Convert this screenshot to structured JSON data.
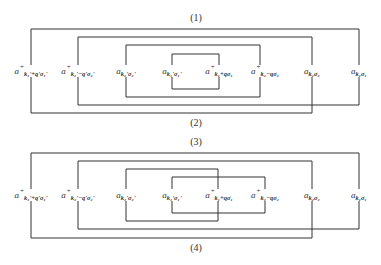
{
  "colors": {
    "line": "#333333",
    "text": "#333333",
    "background": "#ffffff"
  },
  "diagrams": [
    {
      "top_caption": "(1)",
      "bottom_caption": "(2)",
      "operators": [
        {
          "base": "a",
          "dagger": "+",
          "sub": "k₁'+q'σ₁'"
        },
        {
          "base": "a",
          "dagger": "+",
          "sub": "k₂'−q'σ₂'"
        },
        {
          "base": "a",
          "dagger": "",
          "sub": "k₂'σ₂'"
        },
        {
          "base": "a",
          "dagger": "",
          "sub": "k₁'σ₁'"
        },
        {
          "base": "a",
          "dagger": "+",
          "sub": "k₁+qσ₁"
        },
        {
          "base": "a",
          "dagger": "+",
          "sub": "k₂−qσ₂"
        },
        {
          "base": "a",
          "dagger": "",
          "sub": "k₂σ₂"
        },
        {
          "base": "a",
          "dagger": "",
          "sub": "k₁σ₁"
        }
      ]
    },
    {
      "top_caption": "(3)",
      "bottom_caption": "(4)",
      "operators": [
        {
          "base": "a",
          "dagger": "+",
          "sub": "k₁'+q'σ₁'"
        },
        {
          "base": "a",
          "dagger": "+",
          "sub": "k₂'−q'σ₂'"
        },
        {
          "base": "a",
          "dagger": "",
          "sub": "k₂'σ₂'"
        },
        {
          "base": "a",
          "dagger": "",
          "sub": "k₁'σ₁'"
        },
        {
          "base": "a",
          "dagger": "+",
          "sub": "k₁+qσ₁"
        },
        {
          "base": "a",
          "dagger": "+",
          "sub": "k₂−qσ₂"
        },
        {
          "base": "a",
          "dagger": "",
          "sub": "k₂σ₂"
        },
        {
          "base": "a",
          "dagger": "",
          "sub": "k₁σ₁"
        }
      ]
    }
  ]
}
